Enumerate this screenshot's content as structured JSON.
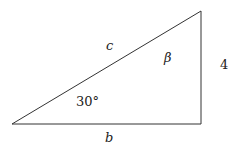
{
  "diagram": {
    "type": "right-triangle",
    "vertices": {
      "bottom_left": [
        12,
        124
      ],
      "bottom_right": [
        201,
        124
      ],
      "top_right": [
        201,
        11
      ]
    },
    "labels": {
      "hypotenuse": "c",
      "base": "b",
      "height": "4",
      "angle_bottom_left": "30°",
      "angle_top_right": "β"
    },
    "stroke_color": "#333333"
  }
}
